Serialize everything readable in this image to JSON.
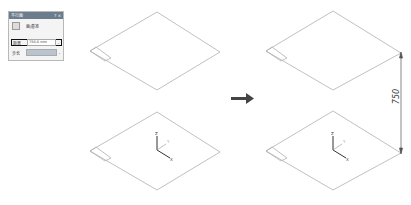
{
  "dialog": {
    "title": "平行面",
    "close_label": "? ×",
    "reference_label": "面/基准",
    "fields": [
      {
        "label": "距离",
        "value": "750.0 mm",
        "dropdown": "⌄"
      },
      {
        "label": "步长",
        "value": "",
        "dropdown": "⌄"
      }
    ]
  },
  "diagram": {
    "dimension_value": "750",
    "axis_labels": {
      "z": "Z",
      "y": "Y",
      "x": "X"
    },
    "colors": {
      "plane_edge": "#b0b0b0",
      "arrow": "#444444",
      "dimension": "#555555"
    }
  }
}
